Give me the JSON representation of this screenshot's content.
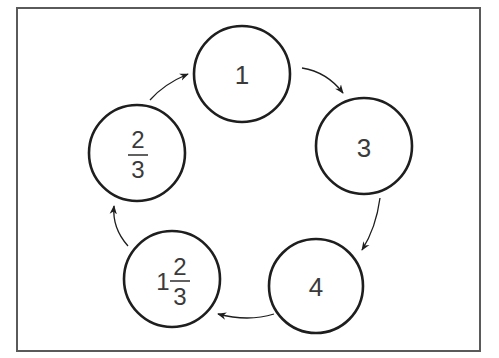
{
  "diagram": {
    "type": "cycle",
    "frame": {
      "x": 17,
      "y": 8,
      "width": 463,
      "height": 343,
      "stroke": "#5a5a5a"
    },
    "nodes": [
      {
        "id": "n1",
        "label": "1",
        "cx": 242,
        "cy": 74,
        "r": 48
      },
      {
        "id": "n2",
        "label": "3",
        "cx": 364,
        "cy": 146,
        "r": 48
      },
      {
        "id": "n3",
        "label": "4",
        "cx": 316,
        "cy": 286,
        "r": 47
      },
      {
        "id": "n4",
        "whole": "1",
        "numerator": "2",
        "denominator": "3",
        "cx": 172,
        "cy": 279,
        "r": 48
      },
      {
        "id": "n5",
        "numerator": "2",
        "denominator": "3",
        "cx": 137,
        "cy": 153,
        "r": 48
      }
    ],
    "edges": [
      {
        "from": "n1",
        "to": "n2"
      },
      {
        "from": "n2",
        "to": "n3"
      },
      {
        "from": "n3",
        "to": "n4"
      },
      {
        "from": "n4",
        "to": "n5"
      },
      {
        "from": "n5",
        "to": "n1"
      }
    ],
    "stroke_color": "#1e1e1e",
    "text_color": "#3a3a3a"
  }
}
